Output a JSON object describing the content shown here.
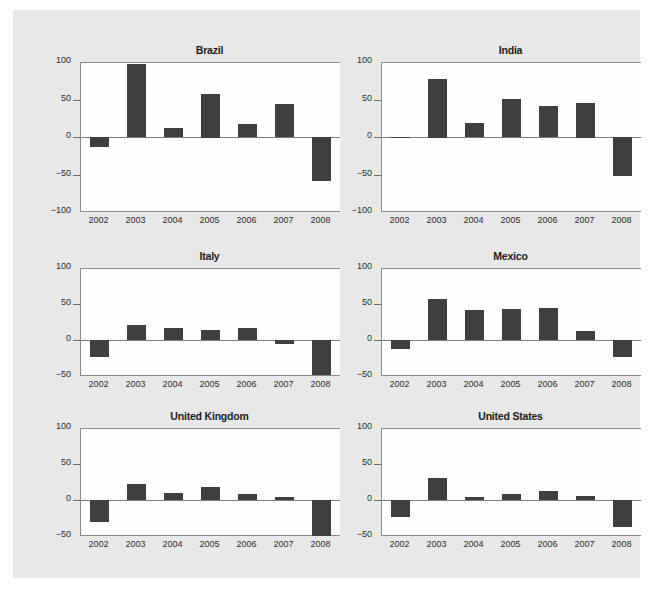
{
  "figure": {
    "background_color": "#e8e8e8",
    "panel_background_color": "#fefefe",
    "bar_color": "#3f3f3f",
    "axis_color": "#8a8a8a"
  },
  "chart_data": [
    {
      "type": "bar",
      "title": "Brazil",
      "xlabel": "",
      "ylabel": "",
      "categories": [
        "2002",
        "2003",
        "2004",
        "2005",
        "2006",
        "2007",
        "2008"
      ],
      "values": [
        -13,
        97,
        12,
        58,
        17,
        44,
        -58
      ],
      "ylim": [
        -100,
        100
      ],
      "yticks": [
        100,
        50,
        0,
        -50,
        -100
      ],
      "ytick_labels": [
        "100",
        "50",
        "0",
        "-50",
        "-100"
      ],
      "grid": false,
      "legend": "none"
    },
    {
      "type": "bar",
      "title": "India",
      "xlabel": "",
      "ylabel": "",
      "categories": [
        "2002",
        "2003",
        "2004",
        "2005",
        "2006",
        "2007",
        "2008"
      ],
      "values": [
        -1,
        78,
        18,
        51,
        41,
        46,
        -52
      ],
      "ylim": [
        -100,
        100
      ],
      "yticks": [
        100,
        50,
        0,
        -50,
        -100
      ],
      "ytick_labels": [
        "100",
        "50",
        "0",
        "-50",
        "-100"
      ],
      "grid": false,
      "legend": "none"
    },
    {
      "type": "bar",
      "title": "Italy",
      "xlabel": "",
      "ylabel": "",
      "categories": [
        "2002",
        "2003",
        "2004",
        "2005",
        "2006",
        "2007",
        "2008"
      ],
      "values": [
        -24,
        21,
        17,
        14,
        17,
        -6,
        -49
      ],
      "ylim": [
        -50,
        100
      ],
      "yticks": [
        100,
        50,
        0,
        -50
      ],
      "ytick_labels": [
        "100",
        "50",
        "0",
        "-50"
      ],
      "grid": false,
      "legend": "none"
    },
    {
      "type": "bar",
      "title": "Mexico",
      "xlabel": "",
      "ylabel": "",
      "categories": [
        "2002",
        "2003",
        "2004",
        "2005",
        "2006",
        "2007",
        "2008"
      ],
      "values": [
        -13,
        57,
        41,
        43,
        44,
        12,
        -24
      ],
      "ylim": [
        -50,
        100
      ],
      "yticks": [
        100,
        50,
        0,
        -50
      ],
      "ytick_labels": [
        "100",
        "50",
        "0",
        "-50"
      ],
      "grid": false,
      "legend": "none"
    },
    {
      "type": "bar",
      "title": "United Kingdom",
      "xlabel": "",
      "ylabel": "",
      "categories": [
        "2002",
        "2003",
        "2004",
        "2005",
        "2006",
        "2007",
        "2008"
      ],
      "values": [
        -31,
        22,
        10,
        18,
        9,
        4,
        -50
      ],
      "ylim": [
        -50,
        100
      ],
      "yticks": [
        100,
        50,
        0,
        -50
      ],
      "ytick_labels": [
        "100",
        "50",
        "0",
        "-50"
      ],
      "grid": false,
      "legend": "none"
    },
    {
      "type": "bar",
      "title": "United States",
      "xlabel": "",
      "ylabel": "",
      "categories": [
        "2002",
        "2003",
        "2004",
        "2005",
        "2006",
        "2007",
        "2008"
      ],
      "values": [
        -23,
        31,
        4,
        8,
        12,
        6,
        -38
      ],
      "ylim": [
        -50,
        100
      ],
      "yticks": [
        100,
        50,
        0,
        -50
      ],
      "ytick_labels": [
        "100",
        "50",
        "0",
        "-50"
      ],
      "grid": false,
      "legend": "none"
    }
  ]
}
